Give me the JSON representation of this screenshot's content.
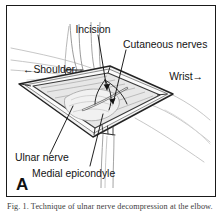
{
  "figure": {
    "panel_letter": "A",
    "caption": "Fig. 1. Technique of ulnar nerve decompression at the elbow.",
    "orientation": {
      "left_label": "Shoulder",
      "left_arrow": "←",
      "right_label": "Wrist",
      "right_arrow": "→"
    },
    "labels": [
      {
        "id": "incision",
        "text": "Incision"
      },
      {
        "id": "cutaneous-nerves",
        "text": "Cutaneous nerves"
      },
      {
        "id": "shoulder",
        "text": "←Shoulder"
      },
      {
        "id": "wrist",
        "text": "Wrist→"
      },
      {
        "id": "ulnar-nerve",
        "text": "Ulnar nerve"
      },
      {
        "id": "medial-epicondyle",
        "text": "Medial epicondyle"
      }
    ],
    "colors": {
      "frame": "#1a1a1a",
      "background": "#ffffff",
      "ink": "#141414",
      "skin_outline": "#b9b9b9",
      "wound_edge": "#2b2b2b",
      "wound_fill": "#e9e9e9",
      "tissue_shadow": "#9a9a9a",
      "caption_text": "#3d3d3d"
    }
  }
}
